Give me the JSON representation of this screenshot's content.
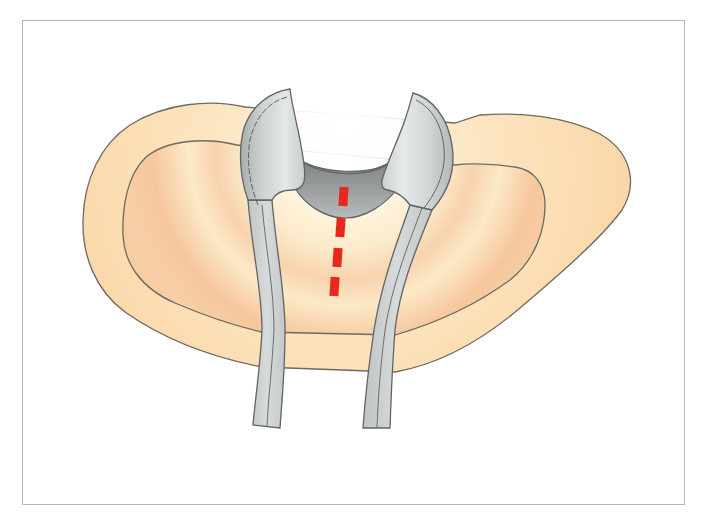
{
  "figure": {
    "type": "medical illustration",
    "subject": "surgical retractor spreading tissue with red dashed incision line",
    "caption": ""
  },
  "colors": {
    "background": "#ffffff",
    "frame_border": "#b8b8b8",
    "tissue_outer": "#fbdcb0",
    "tissue_inner_cream": "#fcebcc",
    "tissue_inner_peach": "#f6c79d",
    "tissue_outline": "#6e6a62",
    "retractor_light": "#dfe2e2",
    "retractor_mid": "#c4c8c8",
    "retractor_dark": "#8c8f8f",
    "retractor_outline": "#5f6464",
    "incision_line": "#e8281c"
  },
  "elements": {
    "outer_tissue_layer": "outer tissue layer",
    "inner_tissue_layer": "inner tissue layer",
    "left_retractor_blade": "left retractor blade",
    "right_retractor_blade": "right retractor blade",
    "retractor_cup": "retractor cup (exposed cavity)",
    "incision_line": "red dashed incision line"
  },
  "incision_dashes": [
    {
      "x": 339,
      "y": 187,
      "w": 9,
      "h": 19
    },
    {
      "x": 336,
      "y": 218,
      "w": 9,
      "h": 19
    },
    {
      "x": 333,
      "y": 248,
      "w": 9,
      "h": 19
    },
    {
      "x": 330,
      "y": 277,
      "w": 9,
      "h": 19
    }
  ]
}
